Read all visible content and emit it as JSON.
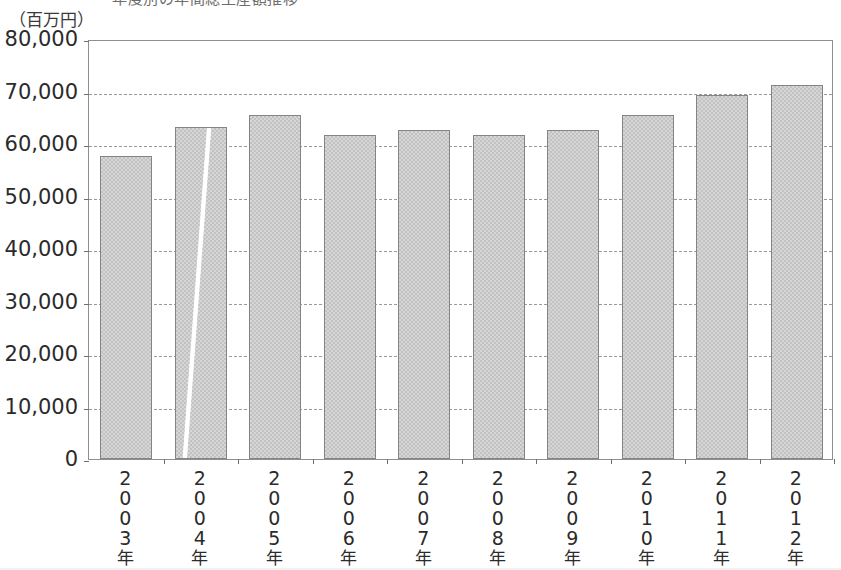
{
  "title": {
    "text": "年度別の年間総生産額推移",
    "visible_partial": true
  },
  "unit_label": "（百万円）",
  "chart_data": {
    "type": "bar",
    "title": "年度別の年間総生産額推移",
    "xlabel": "",
    "ylabel": "（百万円）",
    "ylim": [
      0,
      80000
    ],
    "ytick_step": 10000,
    "grid": true,
    "legend": "none",
    "categories": [
      "2003年",
      "2004年",
      "2005年",
      "2006年",
      "2007年",
      "2008年",
      "2009年",
      "2010年",
      "2011年",
      "2012年"
    ],
    "values": [
      57700,
      63200,
      65500,
      61700,
      62700,
      61800,
      62700,
      65500,
      69400,
      71300
    ],
    "ytick_labels": [
      "80,000",
      "70,000",
      "60,000",
      "50,000",
      "40,000",
      "30,000",
      "20,000",
      "10,000",
      "0"
    ],
    "ytick_values": [
      80000,
      70000,
      60000,
      50000,
      40000,
      30000,
      20000,
      10000,
      0
    ]
  },
  "colors": {
    "bar_fill": "#d6d6d6",
    "bar_pattern": "#c2c2c2",
    "bar_border": "#848484",
    "gridline": "#9a9a9a",
    "axis": "#8f8f8f",
    "text": "#2b2b2b",
    "background": "#ffffff"
  },
  "artifacts": {
    "scratch_on_bar_index": 1,
    "scratch_description": "white diagonal scan line"
  }
}
